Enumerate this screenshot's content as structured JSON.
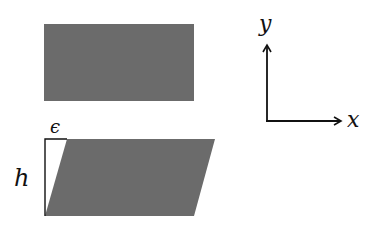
{
  "diagram": {
    "colors": {
      "fill": "#6b6b6b",
      "stroke": "#111111",
      "background": "#ffffff"
    },
    "rectangle": {
      "x": 44,
      "y": 24,
      "width": 150,
      "height": 77
    },
    "parallelogram": {
      "points": "67,139 215,139 194,216 45,216"
    },
    "labels": {
      "epsilon": "ϵ",
      "height": "h",
      "x_axis": "x",
      "y_axis": "y"
    }
  }
}
